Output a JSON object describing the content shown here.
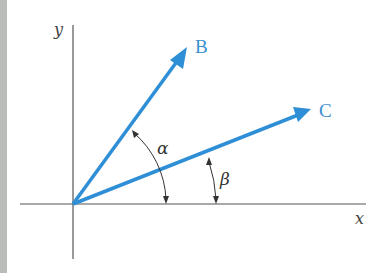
{
  "colors": {
    "vector": "#2e8fd6",
    "axis": "#555555",
    "arc": "#333333",
    "strip": "#b9bcb9"
  },
  "axes": {
    "x_label": "x",
    "y_label": "y"
  },
  "vectors": [
    {
      "name": "B",
      "label": "B"
    },
    {
      "name": "C",
      "label": "C"
    }
  ],
  "angles": [
    {
      "name": "alpha",
      "label": "α",
      "between": [
        "x-axis",
        "B"
      ]
    },
    {
      "name": "beta",
      "label": "β",
      "between": [
        "x-axis",
        "C"
      ]
    }
  ]
}
